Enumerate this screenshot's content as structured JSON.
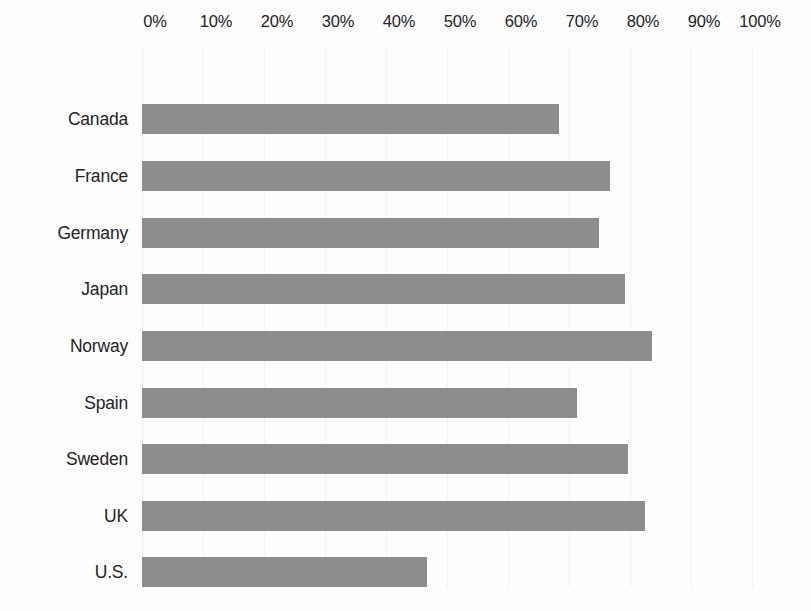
{
  "chart_data": {
    "type": "bar",
    "orientation": "horizontal",
    "title": "",
    "subtitle": "",
    "xlabel": "",
    "ylabel": "",
    "categories": [
      "Canada",
      "France",
      "Germany",
      "Japan",
      "Norway",
      "Spain",
      "Sweden",
      "UK",
      "U.S."
    ],
    "values": [
      68.4,
      76.7,
      74.9,
      79.2,
      83.6,
      71.3,
      79.7,
      82.4,
      46.7
    ],
    "value_unit": "%",
    "xlim": [
      0,
      100
    ],
    "x_tick_labels": [
      "0%",
      "10%",
      "20%",
      "30%",
      "40%",
      "50%",
      "60%",
      "70%",
      "80%",
      "90%",
      "100%"
    ],
    "x_tick_values": [
      0,
      10,
      20,
      30,
      40,
      50,
      60,
      70,
      80,
      90,
      100
    ],
    "grid": true,
    "grid_axis": "x",
    "legend": false,
    "legend_position": "none",
    "series": [
      {
        "name": "",
        "values": [
          68.4,
          76.7,
          74.9,
          79.2,
          83.6,
          71.3,
          79.7,
          82.4,
          46.7
        ]
      }
    ],
    "annotations": [],
    "colors": {
      "bar": "#8d8d8d",
      "background": "#fdfdfd",
      "gridline": "#f1f1f1",
      "text": "#232323"
    }
  }
}
